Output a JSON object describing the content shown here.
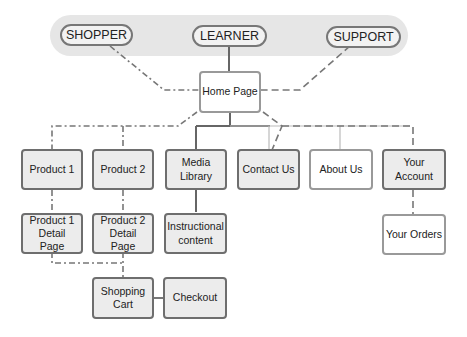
{
  "diagram": {
    "personas": [
      {
        "id": "shopper",
        "label": "SHOPPER"
      },
      {
        "id": "learner",
        "label": "LEARNER"
      },
      {
        "id": "support",
        "label": "SUPPORT"
      }
    ],
    "home": {
      "label": "Home Page"
    },
    "level1": [
      {
        "id": "product1",
        "label": "Product 1"
      },
      {
        "id": "product2",
        "label": "Product 2"
      },
      {
        "id": "media",
        "label": "Media Library"
      },
      {
        "id": "contact",
        "label": "Contact Us"
      },
      {
        "id": "about",
        "label": "About Us"
      },
      {
        "id": "account",
        "label": "Your Account"
      }
    ],
    "level2": [
      {
        "id": "p1detail",
        "label": "Product 1 Detail Page"
      },
      {
        "id": "p2detail",
        "label": "Product 2 Detail Page"
      },
      {
        "id": "instructional",
        "label": "Instructional content"
      },
      {
        "id": "orders",
        "label": "Your Orders"
      }
    ],
    "level3": [
      {
        "id": "cart",
        "label": "Shopping Cart"
      },
      {
        "id": "checkout",
        "label": "Checkout"
      }
    ]
  }
}
